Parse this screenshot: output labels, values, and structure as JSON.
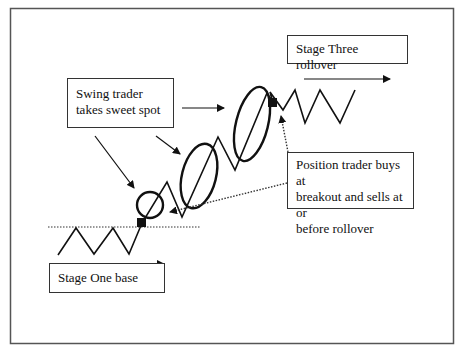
{
  "diagram": {
    "labels": {
      "swing_trader": [
        "Swing trader",
        "takes sweet spot"
      ],
      "stage_three": "Stage Three rollover",
      "position_trader": [
        "Position trader buys at",
        "breakout and sells at or",
        "before rollover"
      ],
      "stage_one": "Stage One base"
    },
    "colors": {
      "line": "#111111",
      "frame": "#555555",
      "background": "#ffffff"
    },
    "elements": {
      "frame": {
        "x": 10,
        "y": 8,
        "w": 443,
        "h": 335
      },
      "breakout_line_y": 227,
      "markers": [
        {
          "name": "breakout-marker",
          "x": 142,
          "y": 223
        },
        {
          "name": "rollover-marker",
          "x": 273,
          "y": 103
        }
      ],
      "ellipses": [
        {
          "name": "swing-circle-1",
          "cx": 150,
          "cy": 205,
          "rx": 13,
          "ry": 13
        },
        {
          "name": "swing-ellipse-2",
          "cx": 199,
          "cy": 176,
          "rx": 17,
          "ry": 33
        },
        {
          "name": "swing-ellipse-3",
          "cx": 252,
          "cy": 124,
          "rx": 16,
          "ry": 38
        }
      ]
    }
  }
}
